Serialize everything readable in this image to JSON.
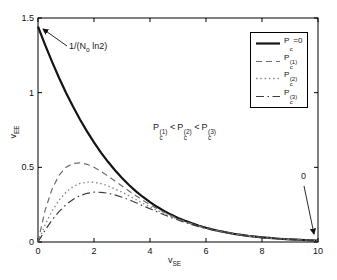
{
  "figure": {
    "background": "#ffffff",
    "axis_color": "#000000",
    "text_color": "#111111"
  },
  "chart_data": {
    "type": "line",
    "title": "",
    "xlabel": {
      "base": "v",
      "sub": "SE"
    },
    "ylabel": {
      "base": "v",
      "sub": "EE"
    },
    "xlim": [
      0,
      10
    ],
    "ylim": [
      0,
      1.5
    ],
    "xticks": [
      0,
      2,
      4,
      6,
      8,
      10
    ],
    "yticks": [
      0,
      0.5,
      1,
      1.5
    ],
    "grid": false,
    "legend_position": "top-right",
    "x": [
      0,
      0.25,
      0.5,
      0.75,
      1,
      1.25,
      1.5,
      1.75,
      2,
      2.25,
      2.5,
      2.75,
      3,
      3.25,
      3.5,
      3.75,
      4,
      4.25,
      4.5,
      4.75,
      5,
      5.25,
      5.5,
      5.75,
      6,
      6.25,
      6.5,
      6.75,
      7,
      7.25,
      7.5,
      7.75,
      8,
      8.25,
      8.5,
      8.75,
      9,
      9.25,
      9.5,
      9.75,
      10
    ],
    "series": [
      {
        "name": "Pc=0",
        "style": "solid",
        "color": "#141414",
        "width": 2.2,
        "values": [
          1.4427,
          1.3213,
          1.2071,
          1.1,
          1.0,
          0.9068,
          0.8204,
          0.7404,
          0.6667,
          0.5989,
          0.5368,
          0.4802,
          0.4286,
          0.3817,
          0.3394,
          0.3011,
          0.2667,
          0.2358,
          0.2081,
          0.1833,
          0.1613,
          0.1417,
          0.1243,
          0.1089,
          0.0952,
          0.0832,
          0.0726,
          0.0633,
          0.0551,
          0.0479,
          0.0417,
          0.0362,
          0.0314,
          0.0272,
          0.0235,
          0.0204,
          0.0176,
          0.0152,
          0.0131,
          0.0113,
          0.0098
        ]
      },
      {
        "name": "Pc(1)",
        "style": "dashed",
        "color": "#6e6e6e",
        "width": 1.2,
        "values": [
          0,
          0.2102,
          0.3536,
          0.446,
          0.5,
          0.5256,
          0.5303,
          0.5203,
          0.5,
          0.473,
          0.4419,
          0.4088,
          0.375,
          0.3416,
          0.3094,
          0.2787,
          0.25,
          0.2234,
          0.1989,
          0.1765,
          0.1563,
          0.138,
          0.1215,
          0.1068,
          0.0938,
          0.0821,
          0.0718,
          0.0627,
          0.0547,
          0.0476,
          0.0414,
          0.036,
          0.0313,
          0.0271,
          0.0235,
          0.0203,
          0.0176,
          0.0152,
          0.0131,
          0.0113,
          0.0098
        ]
      },
      {
        "name": "Pc(2)",
        "style": "dotted",
        "color": "#8a8a8a",
        "width": 1.4,
        "values": [
          0,
          0.1142,
          0.2071,
          0.2797,
          0.3333,
          0.37,
          0.3918,
          0.4011,
          0.4,
          0.3908,
          0.3756,
          0.3559,
          0.3333,
          0.3091,
          0.2842,
          0.2594,
          0.2353,
          0.2122,
          0.1905,
          0.1702,
          0.1515,
          0.1344,
          0.1189,
          0.1049,
          0.0923,
          0.0811,
          0.071,
          0.0621,
          0.0543,
          0.0473,
          0.0412,
          0.0358,
          0.0311,
          0.027,
          0.0234,
          0.0203,
          0.0175,
          0.0152,
          0.0131,
          0.0113,
          0.0098
        ]
      },
      {
        "name": "Pc(3)",
        "style": "dashdot",
        "color": "#3c3c3c",
        "width": 1.2,
        "values": [
          0,
          0.0784,
          0.1464,
          0.2037,
          0.25,
          0.2855,
          0.3107,
          0.3263,
          0.3333,
          0.333,
          0.3265,
          0.3151,
          0.3,
          0.2823,
          0.2629,
          0.2426,
          0.2222,
          0.2021,
          0.1827,
          0.1643,
          0.1471,
          0.1311,
          0.1164,
          0.103,
          0.0909,
          0.08,
          0.0703,
          0.0616,
          0.0538,
          0.047,
          0.041,
          0.0357,
          0.031,
          0.0269,
          0.0233,
          0.0202,
          0.0175,
          0.0151,
          0.0131,
          0.0113,
          0.0097
        ]
      }
    ],
    "legend": {
      "items": [
        {
          "base": "P",
          "sub": "c",
          "sup": "",
          "suffix": "=0"
        },
        {
          "base": "P",
          "sub": "c",
          "sup": "(1)",
          "suffix": ""
        },
        {
          "base": "P",
          "sub": "c",
          "sup": "(2)",
          "suffix": ""
        },
        {
          "base": "P",
          "sub": "c",
          "sup": "(3)",
          "suffix": ""
        }
      ]
    },
    "annotations": {
      "limit": {
        "pre": "1/(N",
        "sub": "o",
        "post": " ln2)",
        "target": [
          0,
          1.4427
        ]
      },
      "zero": {
        "label": "0",
        "target": [
          10,
          0
        ]
      },
      "inequality": {
        "t1": {
          "base": "P",
          "sub": "c",
          "sup": "(1)"
        },
        "lt1": "<",
        "t2": {
          "base": "P",
          "sub": "c",
          "sup": "(2)"
        },
        "lt2": "<",
        "t3": {
          "base": "P",
          "sub": "c",
          "sup": "(3)"
        }
      }
    }
  }
}
